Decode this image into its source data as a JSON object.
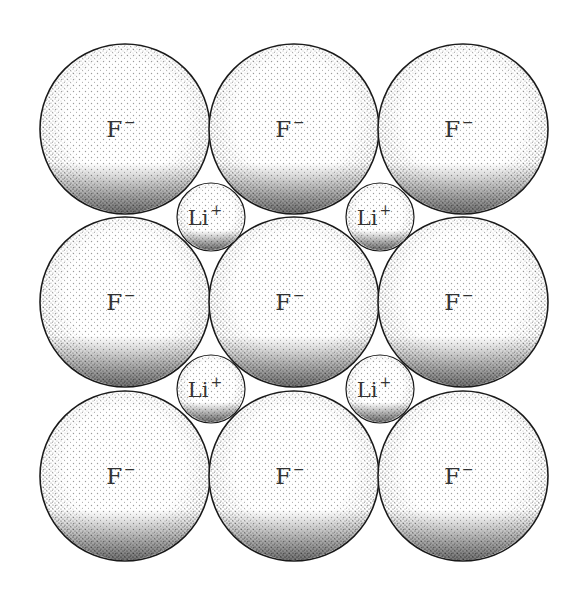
{
  "diagram": {
    "colors": {
      "background": "#ffffff",
      "outline": "#1a1a1a",
      "stipple": "#222222",
      "label": "#333333"
    },
    "anions": [
      {
        "label": "F",
        "charge": "−",
        "cx": 125,
        "cy": 129,
        "r": 85
      },
      {
        "label": "F",
        "charge": "−",
        "cx": 294,
        "cy": 129,
        "r": 85
      },
      {
        "label": "F",
        "charge": "−",
        "cx": 463,
        "cy": 129,
        "r": 85
      },
      {
        "label": "F",
        "charge": "−",
        "cx": 125,
        "cy": 302,
        "r": 85
      },
      {
        "label": "F",
        "charge": "−",
        "cx": 294,
        "cy": 302,
        "r": 85
      },
      {
        "label": "F",
        "charge": "−",
        "cx": 463,
        "cy": 302,
        "r": 85
      },
      {
        "label": "F",
        "charge": "−",
        "cx": 125,
        "cy": 476,
        "r": 85
      },
      {
        "label": "F",
        "charge": "−",
        "cx": 294,
        "cy": 476,
        "r": 85
      },
      {
        "label": "F",
        "charge": "−",
        "cx": 463,
        "cy": 476,
        "r": 85
      }
    ],
    "cations": [
      {
        "label": "Li",
        "charge": "+",
        "cx": 211,
        "cy": 217,
        "r": 34
      },
      {
        "label": "Li",
        "charge": "+",
        "cx": 380,
        "cy": 217,
        "r": 34
      },
      {
        "label": "Li",
        "charge": "+",
        "cx": 211,
        "cy": 389,
        "r": 34
      },
      {
        "label": "Li",
        "charge": "+",
        "cx": 380,
        "cy": 389,
        "r": 34
      }
    ]
  }
}
